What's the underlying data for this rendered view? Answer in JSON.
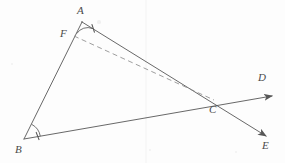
{
  "figure": {
    "kind": "euclidean-geometry-diagram",
    "width": 285,
    "height": 163,
    "background_color": "#fdfdfd",
    "stroke_color": "#575757",
    "dashed_stroke_color": "#8c8c8c",
    "label_color": "#4a4a4a",
    "stroke_width": 0.9,
    "points": [
      {
        "name": "A",
        "label": "A",
        "x": 82,
        "y": 22,
        "label_x": 77,
        "label_y": 5
      },
      {
        "name": "F",
        "label": "F",
        "x": 74,
        "y": 36,
        "label_x": 60,
        "label_y": 28
      },
      {
        "name": "B",
        "label": "B",
        "x": 24,
        "y": 139,
        "label_x": 15,
        "label_y": 144
      },
      {
        "name": "C",
        "label": "C",
        "x": 212,
        "y": 99,
        "label_x": 209,
        "label_y": 104
      },
      {
        "name": "D",
        "label": "D",
        "x": 272,
        "y": 96,
        "label_x": 258,
        "label_y": 72
      },
      {
        "name": "E",
        "label": "E",
        "x": 266,
        "y": 136,
        "label_x": 262,
        "label_y": 140
      }
    ],
    "segments": [
      {
        "name": "segment-AB",
        "from": "A",
        "to": "B",
        "style": "solid"
      },
      {
        "name": "segment-BC-ray-BD",
        "from": "B",
        "to": "D",
        "style": "solid",
        "arrow": "end"
      },
      {
        "name": "segment-AC-ray-AE",
        "from": "A",
        "to": "E",
        "style": "solid",
        "arrow": "end"
      },
      {
        "name": "segment-FC-dashed",
        "from": "F",
        "to": "C",
        "style": "dashed"
      }
    ],
    "angle_marks": [
      {
        "name": "angle-mark-A",
        "at": "A",
        "arcs": 1,
        "tick": true
      },
      {
        "name": "angle-mark-B",
        "at": "B",
        "arcs": 1,
        "tick": true
      }
    ],
    "artifacts": {
      "scan_seam_x": 145,
      "specks": [
        {
          "x": 99,
          "y": 22,
          "r": 1.6
        },
        {
          "x": 12,
          "y": 64,
          "r": 1.1
        },
        {
          "x": 236,
          "y": 152,
          "r": 1.0
        },
        {
          "x": 150,
          "y": 150,
          "r": 0.9
        }
      ]
    }
  }
}
